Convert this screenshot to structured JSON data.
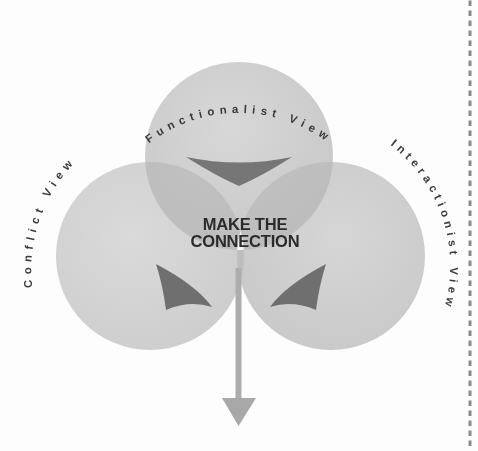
{
  "figure": {
    "title_center_line1": "MAKE THE",
    "title_center_line2": "CONNECTION",
    "background_color": "#fdfdfd"
  },
  "circles": [
    {
      "id": "functionalist",
      "label": "Functionalist View",
      "position": "top",
      "cx": 239,
      "cy": 156,
      "r": 94,
      "fill": "#c9c9c9"
    },
    {
      "id": "conflict",
      "label": "Conflict View",
      "position": "left",
      "cx": 150,
      "cy": 256,
      "r": 94,
      "fill": "#d2d2d2"
    },
    {
      "id": "interactionist",
      "label": "Interactionist View",
      "position": "right",
      "cx": 331,
      "cy": 256,
      "r": 94,
      "fill": "#cccccc"
    }
  ],
  "center_region": {
    "name": "make-the-connection",
    "fill": "#fafafa"
  },
  "arrows": {
    "inward_count": 3,
    "inward_fill": "#6f6f6f",
    "outflow_label": "downward-output-arrow",
    "outflow_fill": "#a8a8a8"
  },
  "decor": {
    "right_dotted_rule": "vertical-dotted-line",
    "dot_color": "#8a8a8a"
  },
  "colors": {
    "circle_base": "#cfcfcf",
    "overlap": "#bdbdbd",
    "center": "#fafafa",
    "arrow_dark": "#6f6f6f",
    "text": "#2b2b2b"
  }
}
